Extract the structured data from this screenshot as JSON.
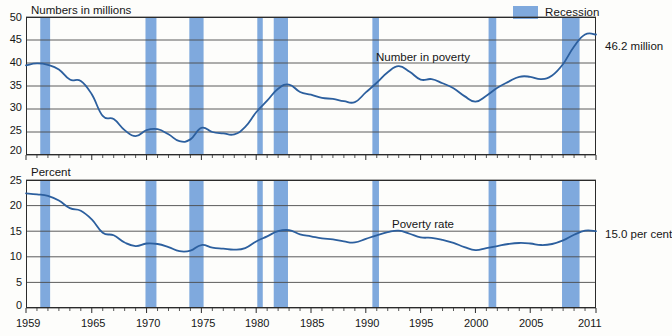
{
  "page": {
    "width": 668,
    "height": 336,
    "background": "#fdfdfb"
  },
  "legend": {
    "label": "Recession",
    "swatch_color": "#7fa9dd"
  },
  "colors": {
    "line": "#2c5f9e",
    "recession": "#7fa9dd",
    "gridline": "#4a4a4a",
    "axis": "#2b2b2b"
  },
  "panels": [
    {
      "id": "numbers-in-millions",
      "axis_title": "Numbers in millions",
      "series_label": "Number in poverty",
      "end_label": "46.2 million",
      "yticks": [
        "50",
        "45",
        "40",
        "35",
        "30",
        "25",
        "20"
      ]
    },
    {
      "id": "percent",
      "axis_title": "Percent",
      "series_label": "Poverty rate",
      "end_label": "15.0 per cent",
      "yticks": [
        "25",
        "20",
        "15",
        "10",
        "5",
        "0"
      ]
    }
  ],
  "xticks": [
    "1959",
    "1965",
    "1970",
    "1975",
    "1980",
    "1985",
    "1990",
    "1995",
    "2000",
    "2005",
    "2011"
  ],
  "chart_data": [
    {
      "type": "line",
      "id": "number-in-poverty",
      "title": "Numbers in millions",
      "series_name": "Number in poverty",
      "xlabel": "",
      "ylabel": "Numbers in millions",
      "ylim": [
        20,
        50
      ],
      "xlim": [
        1959,
        2011
      ],
      "ytick_values": [
        20,
        25,
        30,
        35,
        40,
        45,
        50
      ],
      "xtick_values": [
        1959,
        1965,
        1970,
        1975,
        1980,
        1985,
        1990,
        1995,
        2000,
        2005,
        2011
      ],
      "grid": true,
      "legend_position": "top-right",
      "annotation": "46.2 million",
      "x": [
        1959,
        1960,
        1961,
        1962,
        1963,
        1964,
        1965,
        1966,
        1967,
        1968,
        1969,
        1970,
        1971,
        1972,
        1973,
        1974,
        1975,
        1976,
        1977,
        1978,
        1979,
        1980,
        1981,
        1982,
        1983,
        1984,
        1985,
        1986,
        1987,
        1988,
        1989,
        1990,
        1991,
        1992,
        1993,
        1994,
        1995,
        1996,
        1997,
        1998,
        1999,
        2000,
        2001,
        2002,
        2003,
        2004,
        2005,
        2006,
        2007,
        2008,
        2009,
        2010,
        2011
      ],
      "values": [
        39.5,
        39.9,
        39.6,
        38.6,
        36.4,
        36.1,
        33.2,
        28.5,
        27.8,
        25.4,
        24.1,
        25.4,
        25.6,
        24.5,
        23.0,
        23.4,
        25.9,
        25.0,
        24.7,
        24.5,
        26.1,
        29.3,
        31.8,
        34.4,
        35.3,
        33.7,
        33.1,
        32.4,
        32.2,
        31.7,
        31.5,
        33.6,
        35.7,
        38.0,
        39.3,
        38.1,
        36.4,
        36.5,
        35.6,
        34.5,
        32.8,
        31.6,
        32.9,
        34.6,
        35.9,
        37.0,
        37.0,
        36.5,
        37.3,
        39.8,
        43.6,
        46.2,
        46.2
      ]
    },
    {
      "type": "line",
      "id": "poverty-rate",
      "title": "Percent",
      "series_name": "Poverty rate",
      "xlabel": "",
      "ylabel": "Percent",
      "ylim": [
        0,
        25
      ],
      "xlim": [
        1959,
        2011
      ],
      "ytick_values": [
        0,
        5,
        10,
        15,
        20,
        25
      ],
      "xtick_values": [
        1959,
        1965,
        1970,
        1975,
        1980,
        1985,
        1990,
        1995,
        2000,
        2005,
        2011
      ],
      "grid": true,
      "annotation": "15.0 per cent",
      "x": [
        1959,
        1960,
        1961,
        1962,
        1963,
        1964,
        1965,
        1966,
        1967,
        1968,
        1969,
        1970,
        1971,
        1972,
        1973,
        1974,
        1975,
        1976,
        1977,
        1978,
        1979,
        1980,
        1981,
        1982,
        1983,
        1984,
        1985,
        1986,
        1987,
        1988,
        1989,
        1990,
        1991,
        1992,
        1993,
        1994,
        1995,
        1996,
        1997,
        1998,
        1999,
        2000,
        2001,
        2002,
        2003,
        2004,
        2005,
        2006,
        2007,
        2008,
        2009,
        2010,
        2011
      ],
      "values": [
        22.4,
        22.2,
        21.9,
        21.0,
        19.5,
        19.0,
        17.3,
        14.7,
        14.2,
        12.8,
        12.1,
        12.6,
        12.5,
        11.9,
        11.1,
        11.2,
        12.3,
        11.8,
        11.6,
        11.4,
        11.7,
        13.0,
        14.0,
        15.0,
        15.2,
        14.4,
        14.0,
        13.6,
        13.4,
        13.0,
        12.8,
        13.5,
        14.2,
        14.8,
        15.1,
        14.5,
        13.8,
        13.7,
        13.3,
        12.7,
        11.9,
        11.3,
        11.7,
        12.1,
        12.5,
        12.7,
        12.6,
        12.3,
        12.5,
        13.2,
        14.3,
        15.1,
        15.0
      ]
    }
  ],
  "recessions": [
    {
      "start": 1960.3,
      "end": 1961.2
    },
    {
      "start": 1969.9,
      "end": 1970.9
    },
    {
      "start": 1973.9,
      "end": 1975.2
    },
    {
      "start": 1980.1,
      "end": 1980.6
    },
    {
      "start": 1981.6,
      "end": 1982.9
    },
    {
      "start": 1990.6,
      "end": 1991.2
    },
    {
      "start": 2001.2,
      "end": 2001.9
    },
    {
      "start": 2007.9,
      "end": 2009.5
    }
  ]
}
